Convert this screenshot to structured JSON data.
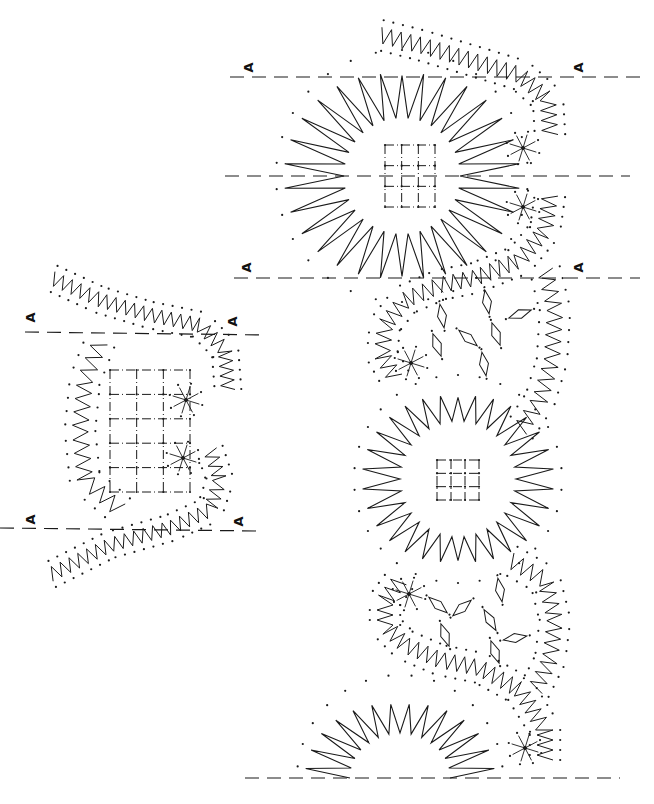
{
  "diagram": {
    "type": "bobbin lace pricking pattern",
    "ink_color": "#1a1a1a",
    "background": "#ffffff",
    "repeat_marker_label": "A",
    "labels": [
      {
        "text": "A",
        "x": 248,
        "y": 68
      },
      {
        "text": "A",
        "x": 578,
        "y": 68
      },
      {
        "text": "A",
        "x": 246,
        "y": 268
      },
      {
        "text": "A",
        "x": 578,
        "y": 268
      },
      {
        "text": "A",
        "x": 30,
        "y": 318
      },
      {
        "text": "A",
        "x": 232,
        "y": 322
      },
      {
        "text": "A",
        "x": 30,
        "y": 520
      },
      {
        "text": "A",
        "x": 238,
        "y": 522
      }
    ],
    "dashed_lines": [
      {
        "x1": 230,
        "y1": 77,
        "x2": 640,
        "y2": 77
      },
      {
        "x1": 225,
        "y1": 176,
        "x2": 630,
        "y2": 176
      },
      {
        "x1": 234,
        "y1": 278,
        "x2": 640,
        "y2": 278
      },
      {
        "x1": 25,
        "y1": 332,
        "x2": 265,
        "y2": 335
      },
      {
        "x1": 0,
        "y1": 528,
        "x2": 258,
        "y2": 531
      },
      {
        "x1": 245,
        "y1": 778,
        "x2": 620,
        "y2": 778
      }
    ],
    "sunbursts": [
      {
        "cx": 402,
        "cy": 176,
        "r_in": 58,
        "r_out": 118,
        "spikes": 30
      },
      {
        "cx": 458,
        "cy": 479,
        "r_in": 58,
        "r_out": 96,
        "spikes": 30
      },
      {
        "cx": 400,
        "cy": 778,
        "r_in": 50,
        "r_out": 95,
        "spikes": 14,
        "half": true
      }
    ],
    "grids": [
      {
        "x": 385,
        "y": 145,
        "w": 50,
        "h": 62,
        "cols": 3,
        "rows": 3
      },
      {
        "x": 437,
        "y": 460,
        "w": 42,
        "h": 40,
        "cols": 3,
        "rows": 3
      },
      {
        "x": 110,
        "y": 370,
        "w": 80,
        "h": 122,
        "cols": 3,
        "rows": 5
      }
    ],
    "small_stars": [
      {
        "cx": 523,
        "cy": 148
      },
      {
        "cx": 523,
        "cy": 207
      },
      {
        "cx": 411,
        "cy": 363
      },
      {
        "cx": 409,
        "cy": 594
      },
      {
        "cx": 186,
        "cy": 400
      },
      {
        "cx": 183,
        "cy": 458
      },
      {
        "cx": 525,
        "cy": 748
      }
    ],
    "diamonds": [
      {
        "cx": 487,
        "cy": 302,
        "a": 80
      },
      {
        "cx": 520,
        "cy": 314,
        "a": -20
      },
      {
        "cx": 442,
        "cy": 316,
        "a": 80
      },
      {
        "cx": 437,
        "cy": 345,
        "a": 70
      },
      {
        "cx": 468,
        "cy": 338,
        "a": 40
      },
      {
        "cx": 496,
        "cy": 334,
        "a": 70
      },
      {
        "cx": 484,
        "cy": 364,
        "a": 80
      },
      {
        "cx": 500,
        "cy": 590,
        "a": 80
      },
      {
        "cx": 462,
        "cy": 608,
        "a": -40
      },
      {
        "cx": 438,
        "cy": 605,
        "a": 40
      },
      {
        "cx": 490,
        "cy": 620,
        "a": 60
      },
      {
        "cx": 445,
        "cy": 635,
        "a": 70
      },
      {
        "cx": 515,
        "cy": 638,
        "a": -10
      },
      {
        "cx": 495,
        "cy": 652,
        "a": 70
      }
    ],
    "zigzags": [
      {
        "pts": [
          [
            380,
            35
          ],
          [
            420,
            45
          ],
          [
            470,
            60
          ],
          [
            520,
            75
          ],
          [
            548,
            100
          ],
          [
            550,
            135
          ]
        ],
        "amp": 8,
        "n": 22
      },
      {
        "pts": [
          [
            550,
            195
          ],
          [
            545,
            230
          ],
          [
            520,
            260
          ],
          [
            475,
            278
          ],
          [
            440,
            285
          ]
        ],
        "amp": 8,
        "n": 16
      },
      {
        "pts": [
          [
            440,
            285
          ],
          [
            405,
            300
          ],
          [
            385,
            325
          ],
          [
            382,
            355
          ],
          [
            395,
            378
          ]
        ],
        "amp": 8,
        "n": 12
      },
      {
        "pts": [
          [
            545,
            270
          ],
          [
            555,
            310
          ],
          [
            552,
            360
          ],
          [
            540,
            400
          ],
          [
            520,
            430
          ]
        ],
        "amp": 8,
        "n": 14
      },
      {
        "pts": [
          [
            400,
            580
          ],
          [
            385,
            600
          ],
          [
            385,
            625
          ],
          [
            405,
            645
          ],
          [
            440,
            660
          ],
          [
            480,
            668
          ],
          [
            520,
            690
          ],
          [
            545,
            730
          ],
          [
            545,
            760
          ]
        ],
        "amp": 8,
        "n": 28
      },
      {
        "pts": [
          [
            510,
            560
          ],
          [
            545,
            580
          ],
          [
            555,
            620
          ],
          [
            550,
            660
          ],
          [
            535,
            690
          ]
        ],
        "amp": 8,
        "n": 14
      },
      {
        "pts": [
          [
            52,
            278
          ],
          [
            100,
            300
          ],
          [
            150,
            315
          ],
          [
            200,
            325
          ],
          [
            225,
            350
          ],
          [
            228,
            390
          ]
        ],
        "amp": 7,
        "n": 24
      },
      {
        "pts": [
          [
            100,
            342
          ],
          [
            85,
            380
          ],
          [
            80,
            430
          ],
          [
            85,
            480
          ],
          [
            120,
            510
          ]
        ],
        "amp": 8,
        "n": 14
      },
      {
        "pts": [
          [
            210,
            450
          ],
          [
            220,
            480
          ],
          [
            210,
            510
          ],
          [
            170,
            528
          ],
          [
            110,
            545
          ],
          [
            50,
            575
          ]
        ],
        "amp": 7,
        "n": 24
      }
    ]
  }
}
